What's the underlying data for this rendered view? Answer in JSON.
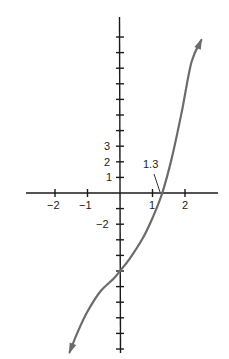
{
  "chart_data": {
    "type": "line",
    "title": "",
    "xlabel": "",
    "ylabel": "",
    "x_ticks": [
      -2,
      -1,
      1,
      2
    ],
    "x_tick_labels": [
      "−2",
      "−1",
      "1",
      "2"
    ],
    "y_tick_labels_shown": [
      {
        "value": 3,
        "label": "3"
      },
      {
        "value": 2,
        "label": "2"
      },
      {
        "value": 1,
        "label": "1"
      },
      {
        "value": -2,
        "label": "−2"
      }
    ],
    "y_tick_values": [
      10,
      9,
      8,
      7,
      6,
      5,
      4,
      3,
      2,
      1,
      -1,
      -2,
      -3,
      -4,
      -5,
      -6,
      -7,
      -8,
      -9,
      -10
    ],
    "xlim": [
      -2.9,
      3.1
    ],
    "ylim": [
      -10.4,
      11.2
    ],
    "grid": false,
    "annotation": {
      "text": "1.3",
      "x": 1.3,
      "y": 0,
      "note": "x-intercept"
    },
    "series": [
      {
        "name": "curve",
        "color": "#6b6b6b",
        "arrows": "both",
        "points": [
          {
            "x": -1.55,
            "y": -10.2
          },
          {
            "x": -1.3,
            "y": -8.9
          },
          {
            "x": -1.0,
            "y": -7.6
          },
          {
            "x": -0.6,
            "y": -6.3
          },
          {
            "x": -0.2,
            "y": -5.5
          },
          {
            "x": 0.0,
            "y": -5.0
          },
          {
            "x": 0.3,
            "y": -4.2
          },
          {
            "x": 0.7,
            "y": -2.9
          },
          {
            "x": 1.0,
            "y": -1.6
          },
          {
            "x": 1.3,
            "y": 0.0
          },
          {
            "x": 1.6,
            "y": 2.3
          },
          {
            "x": 1.9,
            "y": 5.2
          },
          {
            "x": 2.2,
            "y": 8.4
          },
          {
            "x": 2.5,
            "y": 9.8
          }
        ]
      }
    ]
  },
  "labels": {
    "x_neg2": "−2",
    "x_neg1": "−1",
    "x_1": "1",
    "x_2": "2",
    "y_3": "3",
    "y_2": "2",
    "y_1": "1",
    "y_neg2": "−2",
    "intercept": "1.3"
  },
  "colors": {
    "axis": "#1a1a1a",
    "curve": "#6b6b6b",
    "text": "#222222"
  }
}
